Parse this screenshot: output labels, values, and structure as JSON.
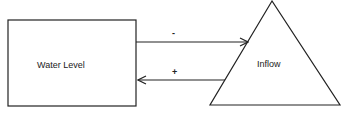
{
  "diagram": {
    "type": "causal-loop",
    "nodes": [
      {
        "id": "water_level",
        "label": "Water Level",
        "shape": "rectangle"
      },
      {
        "id": "inflow",
        "label": "Inflow",
        "shape": "triangle"
      }
    ],
    "edges": [
      {
        "from": "water_level",
        "to": "inflow",
        "sign": "-"
      },
      {
        "from": "inflow",
        "to": "water_level",
        "sign": "+"
      }
    ],
    "stroke_color": "#222222"
  }
}
